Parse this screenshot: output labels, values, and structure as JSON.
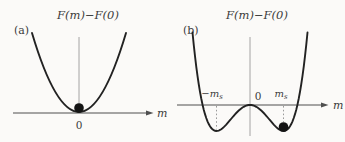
{
  "colors": {
    "curve": "#222222",
    "axis": "#4f4f4f",
    "guide": "#9a9a9a",
    "dotted": "#9a9a9a",
    "text": "#3c3c3c",
    "ball": "#141414",
    "background": "#fbfaf8"
  },
  "panel_a": {
    "tag": "(a)",
    "title": "F(m)−F(0)",
    "axis_label": "m",
    "origin_label": "0",
    "description": "single-well free energy curve; ball (equilibrium state) at m = 0 on the axis"
  },
  "panel_b": {
    "tag": "(b)",
    "title": "F(m)−F(0)",
    "axis_label": "m",
    "origin_label": "0",
    "minus_ms": {
      "base": "−m",
      "sub": "s"
    },
    "plus_ms": {
      "base": "m",
      "sub": "s"
    },
    "description": "double-well free energy curve; minima at ±m_s below the axis, ball at +m_s"
  },
  "geometry": {
    "parabola": {
      "cx": 79,
      "bottomY": 112,
      "topY": 33,
      "halfW": 47
    },
    "double_well": {
      "cx": 250,
      "axisY": 105,
      "a": 2.065e-05,
      "b": 0.04634,
      "dxMax": 57.5
    }
  }
}
